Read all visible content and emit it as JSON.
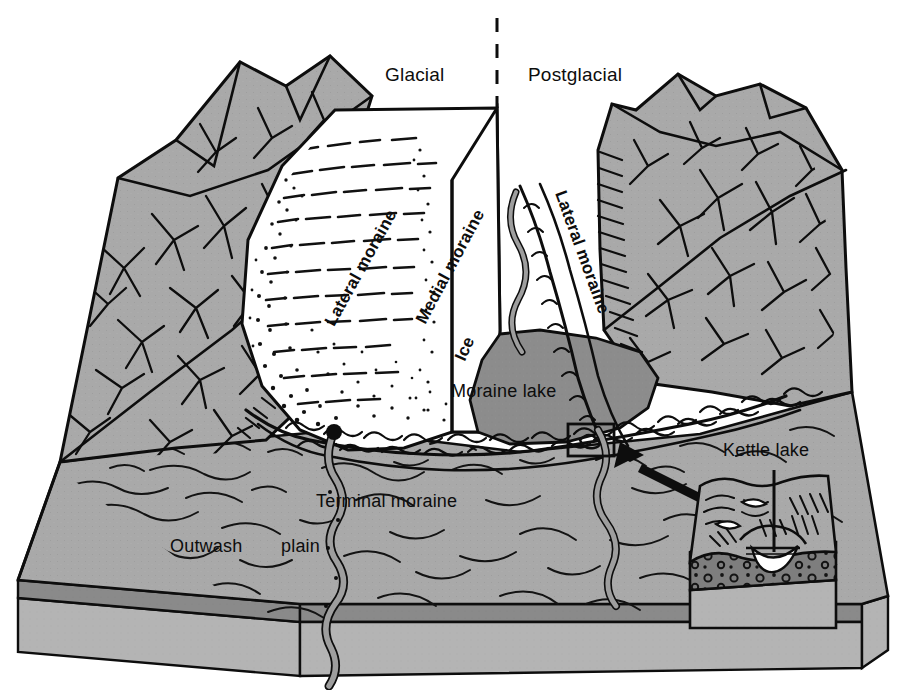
{
  "figure": {
    "type": "block-diagram",
    "background_color": "#ffffff",
    "ink_color": "#0d0d0d",
    "terrain_color": "#a9a9a9",
    "lake_color": "#8c8c8c",
    "ice_color": "#ffffff",
    "stratum_dark_color": "#8a8a8a",
    "stratum_light_color": "#b4b4b4",
    "till_color": "#7e7e7e"
  },
  "era_labels": {
    "left": "Glacial",
    "right": "Postglacial",
    "divider": "dashed-vertical-line"
  },
  "feature_labels": {
    "lateral_moraine_left": "Lateral moraine",
    "medial_moraine": "Medial moraine",
    "ice": "Ice",
    "lateral_moraine_right": "Lateral moraine",
    "moraine_lake": "Moraine lake",
    "terminal_moraine": "Terminal moraine",
    "outwash": "Outwash",
    "plain": "plain",
    "kettle_lake": "Kettle lake"
  },
  "inset": {
    "name": "kettle-lake-detail",
    "callout_box": "source-region-square",
    "arrow": "pointer-arrow-to-source",
    "leader": "leader-line-to-kettle-lake"
  }
}
